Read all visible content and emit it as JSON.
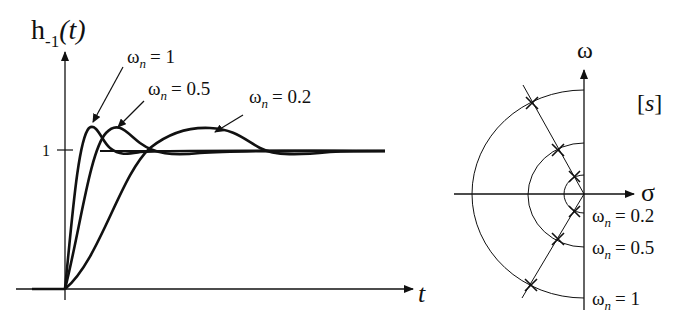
{
  "step_response": {
    "y_axis_label": "h",
    "y_axis_subscript": "-1",
    "y_axis_arg": "(t)",
    "x_axis_label": "t",
    "tick_label_one": "1",
    "curve_labels": [
      {
        "symbol": "ω",
        "sub": "n",
        "value": "= 1"
      },
      {
        "symbol": "ω",
        "sub": "n",
        "value": "= 0.5"
      },
      {
        "symbol": "ω",
        "sub": "n",
        "value": "= 0.2"
      }
    ]
  },
  "pole_plot": {
    "vertical_axis_label": "ω",
    "horizontal_axis_label": "σ",
    "plane_label": "[s]",
    "circle_labels": [
      {
        "symbol": "ω",
        "sub": "n",
        "value": "= 0.2"
      },
      {
        "symbol": "ω",
        "sub": "n",
        "value": "= 0.5"
      },
      {
        "symbol": "ω",
        "sub": "n",
        "value": "= 1"
      }
    ]
  },
  "chart_data": [
    {
      "type": "line",
      "title": "Step response h_-1(t) of second-order system for different natural frequencies",
      "xlabel": "t",
      "ylabel": "h_-1(t)",
      "yticks": [
        1
      ],
      "series": [
        {
          "name": "ωn = 1",
          "overshoot_peak": 1.2,
          "relative_speed": 1
        },
        {
          "name": "ωn = 0.5",
          "overshoot_peak": 1.2,
          "relative_speed": 0.5
        },
        {
          "name": "ωn = 0.2",
          "overshoot_peak": 1.2,
          "relative_speed": 0.2
        }
      ],
      "steady_state": 1
    },
    {
      "type": "scatter",
      "title": "Pole locations in s-plane",
      "xlabel": "σ",
      "ylabel": "ω",
      "series": [
        {
          "name": "ωn = 0.2",
          "radius": 0.2,
          "poles": "conjugate pair on constant-damping line"
        },
        {
          "name": "ωn = 0.5",
          "radius": 0.5,
          "poles": "conjugate pair on constant-damping line"
        },
        {
          "name": "ωn = 1",
          "radius": 1,
          "poles": "conjugate pair on constant-damping line"
        }
      ]
    }
  ]
}
